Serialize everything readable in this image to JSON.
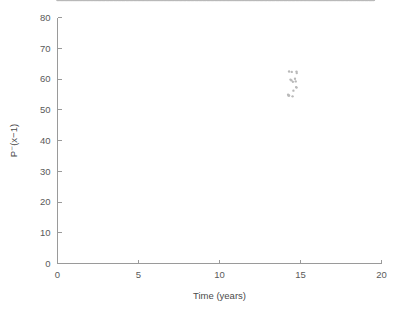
{
  "chart_data": {
    "type": "scatter",
    "title": "",
    "subtitle": "",
    "xlabel": "Time (years)",
    "ylabel": "P⁻(x−1)",
    "xlim": [
      0,
      20
    ],
    "ylim": [
      0,
      80
    ],
    "xticks": [
      0,
      5,
      10,
      15,
      20
    ],
    "xtick_labels": [
      "0",
      "5",
      "10",
      "15",
      "20"
    ],
    "yticks": [
      0,
      10,
      20,
      30,
      40,
      50,
      60,
      70,
      80
    ],
    "ytick_labels": [
      "0",
      "10",
      "20",
      "30",
      "40",
      "50",
      "60",
      "70",
      "80"
    ],
    "grid": false,
    "legend": null,
    "legend_position": "none",
    "marker_color": "#b9b9b9",
    "marker_size_px": 1.3,
    "axis_color": "#9a9a9a",
    "text_color": "#5a5a5a",
    "background_color": "#ffffff",
    "series": [
      {
        "name": "P-(x-1) vs time",
        "n_points": 470,
        "description": "Dense near-linear scatter rising from the origin to about (19.5, 72) with small high-frequency jitter and a vertical outlier spread near x = 14.5",
        "trend_slope": 3.68,
        "trend_intercept": 0.4,
        "noise_amplitude": 0.9,
        "x": [
          0.0,
          0.08,
          0.16,
          0.25,
          0.33,
          0.41,
          0.5,
          0.58,
          0.66,
          0.75,
          0.83,
          0.91,
          1.0,
          1.08,
          1.16,
          1.25,
          1.33,
          1.41,
          1.5,
          1.58,
          1.66,
          1.75,
          1.83,
          1.91,
          2.0,
          2.08,
          2.16,
          2.25,
          2.33,
          2.41,
          2.5,
          2.58,
          2.66,
          2.75,
          2.83,
          2.91,
          3.0,
          3.08,
          3.16,
          3.25,
          3.33,
          3.41,
          3.5,
          3.58,
          3.66,
          3.75,
          3.83,
          3.91,
          4.0,
          4.08,
          4.16,
          4.25,
          4.33,
          4.41,
          4.5,
          4.58,
          4.66,
          4.75,
          4.83,
          4.91,
          5.0,
          5.08,
          5.16,
          5.25,
          5.33,
          5.41,
          5.5,
          5.58,
          5.66,
          5.75,
          5.83,
          5.91,
          6.0,
          6.08,
          6.16,
          6.25,
          6.33,
          6.41,
          6.5,
          6.58,
          6.66,
          6.75,
          6.83,
          6.91,
          7.0,
          7.08,
          7.16,
          7.25,
          7.33,
          7.41,
          7.5,
          7.58,
          7.66,
          7.75,
          7.83,
          7.91,
          8.0,
          8.08,
          8.16,
          8.25,
          8.33,
          8.41,
          8.5,
          8.58,
          8.66,
          8.75,
          8.83,
          8.91,
          9.0,
          9.08,
          9.16,
          9.25,
          9.33,
          9.41,
          9.5,
          9.58,
          9.66,
          9.75,
          9.83,
          9.91,
          10.0,
          10.08,
          10.16,
          10.25,
          10.33,
          10.41,
          10.5,
          10.58,
          10.66,
          10.75,
          10.83,
          10.91,
          11.0,
          11.08,
          11.16,
          11.25,
          11.33,
          11.41,
          11.5,
          11.58,
          11.66,
          11.75,
          11.83,
          11.91,
          12.0,
          12.08,
          12.16,
          12.25,
          12.33,
          12.41,
          12.5,
          12.58,
          12.66,
          12.75,
          12.83,
          12.91,
          13.0,
          13.08,
          13.16,
          13.25,
          13.33,
          13.41,
          13.5,
          13.58,
          13.66,
          13.75,
          13.83,
          13.91,
          14.0,
          14.08,
          14.16,
          14.25,
          14.33,
          14.41,
          14.5,
          14.58,
          14.66,
          14.75,
          14.83,
          14.91,
          15.0,
          15.08,
          15.16,
          15.25,
          15.33,
          15.41,
          15.5,
          15.58,
          15.66,
          15.75,
          15.83,
          15.91,
          16.0,
          16.08,
          16.16,
          16.25,
          16.33,
          16.41,
          16.5,
          16.58,
          16.66,
          16.75,
          16.83,
          16.91,
          17.0,
          17.08,
          17.16,
          17.25,
          17.33,
          17.41,
          17.5,
          17.58,
          17.66,
          17.75,
          17.83,
          17.91,
          18.0,
          18.08,
          18.16,
          18.25,
          18.33,
          18.41,
          18.5,
          18.58,
          18.66,
          18.75,
          18.83,
          18.91,
          19.0,
          19.08,
          19.16,
          19.25,
          19.33,
          19.41,
          19.5
        ],
        "y": [
          0.5,
          0.8,
          1.1,
          1.4,
          1.7,
          2.0,
          2.3,
          2.6,
          2.9,
          3.2,
          3.5,
          3.8,
          4.1,
          4.4,
          4.7,
          5.0,
          5.3,
          5.6,
          5.9,
          6.2,
          6.5,
          6.8,
          7.1,
          7.4,
          7.7,
          8.0,
          8.3,
          8.6,
          9.4,
          9.6,
          9.9,
          10.2,
          10.5,
          10.8,
          11.1,
          11.4,
          11.7,
          12.0,
          12.3,
          12.6,
          12.9,
          13.2,
          13.5,
          14.2,
          14.4,
          14.7,
          15.0,
          15.3,
          15.6,
          15.9,
          16.2,
          16.5,
          16.8,
          17.1,
          17.4,
          17.7,
          18.0,
          18.3,
          18.6,
          18.9,
          19.2,
          19.5,
          19.8,
          20.1,
          20.4,
          20.7,
          21.0,
          21.3,
          21.6,
          21.9,
          22.2,
          22.5,
          22.8,
          23.1,
          23.4,
          23.7,
          24.0,
          24.3,
          24.6,
          24.9,
          25.2,
          25.5,
          25.8,
          26.1,
          26.4,
          26.7,
          27.0,
          27.3,
          27.6,
          27.9,
          28.2,
          28.5,
          28.8,
          29.1,
          29.4,
          29.7,
          30.0,
          30.3,
          30.6,
          30.9,
          31.2,
          31.5,
          31.8,
          32.1,
          32.4,
          32.7,
          33.0,
          33.3,
          33.6,
          33.9,
          34.2,
          34.5,
          34.8,
          35.1,
          35.4,
          35.7,
          36.0,
          36.3,
          36.6,
          36.9,
          37.2,
          37.5,
          37.8,
          38.1,
          38.4,
          38.7,
          39.0,
          39.3,
          39.6,
          39.9,
          40.2,
          40.5,
          41.3,
          41.6,
          41.9,
          42.2,
          42.5,
          42.8,
          43.1,
          43.4,
          43.7,
          44.0,
          44.3,
          44.6,
          44.9,
          45.2,
          45.5,
          45.8,
          46.1,
          46.4,
          46.7,
          47.0,
          47.3,
          47.6,
          47.9,
          48.2,
          48.5,
          48.8,
          49.1,
          49.4,
          49.7,
          50.0,
          50.3,
          50.6,
          50.9,
          51.2,
          51.5,
          51.8,
          52.1,
          52.4,
          52.7,
          53.0,
          55.5,
          58.0,
          60.8,
          56.4,
          56.9,
          57.2,
          57.6,
          58.0,
          58.4,
          58.8,
          59.2,
          59.6,
          60.0,
          60.4,
          60.8,
          61.2,
          61.6,
          62.0,
          62.3,
          62.6,
          62.9,
          63.2,
          63.5,
          63.8,
          64.1,
          64.4,
          64.7,
          65.0,
          65.3,
          65.6,
          65.9,
          66.2,
          66.5,
          66.8,
          67.1,
          67.4,
          67.7,
          68.0,
          68.3,
          68.6,
          68.9,
          69.2,
          69.5,
          69.8,
          70.0,
          70.2,
          70.4,
          70.6,
          70.8,
          71.0,
          71.2,
          71.4,
          71.6,
          71.7,
          71.8,
          71.9,
          72.0,
          72.0,
          72.1,
          72.1,
          72.2,
          72.2,
          72.3
        ]
      }
    ],
    "annotations": [
      {
        "text": "vertical outlier spread",
        "x": 14.5,
        "y_range": [
          54,
          63
        ]
      }
    ]
  }
}
